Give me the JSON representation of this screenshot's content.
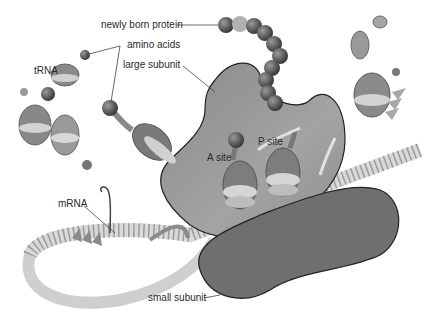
{
  "diagram": {
    "labels": {
      "newly_born_protein": "newly born protein",
      "amino_acids": "amino acids",
      "large_subunit": "large subunit",
      "trna": "tRNA",
      "a_site": "A site",
      "p_site": "P site",
      "mrna": "mRNA",
      "small_subunit": "small subunit"
    },
    "colors": {
      "large_subunit": "#8c8c8c",
      "small_subunit": "#6e6e6e",
      "protein_bead": "#555555",
      "mrna_strand": "#d8d8d8",
      "leader_line": "#444444"
    }
  }
}
